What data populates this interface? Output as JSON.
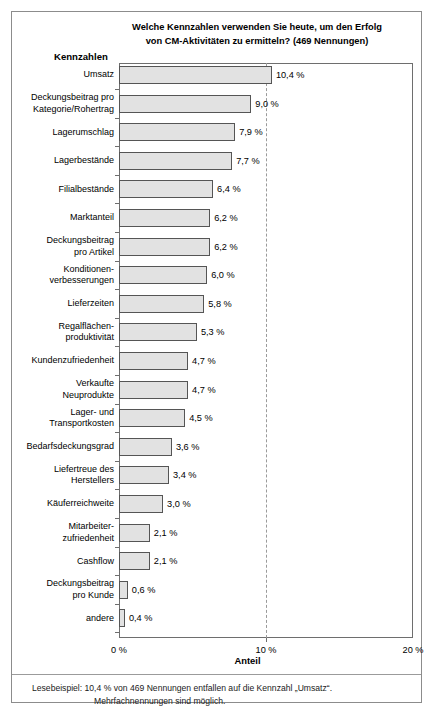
{
  "chart_data": {
    "type": "bar",
    "orientation": "horizontal",
    "title": "Welche Kennzahlen verwenden Sie heute, um den Erfolg von CM-Aktivitäten zu ermitteln? (469 Nennungen)",
    "title_line1": "Welche Kennzahlen verwenden Sie heute, um den Erfolg",
    "title_line2": "von CM-Aktivitäten zu ermitteln? (469 Nennungen)",
    "ylabel": "Kennzahlen",
    "xlabel": "Anteil",
    "xlim": [
      0,
      20
    ],
    "xticks": [
      0,
      10,
      20
    ],
    "xtick_labels": [
      "0 %",
      "10 %",
      "20 %"
    ],
    "gridline_at": 10,
    "grid": false,
    "legend": "none",
    "bar_fill_color": "#e2e2e2",
    "bar_edge_color": "#555555",
    "categories": [
      "Umsatz",
      "Deckungsbeitrag pro\nKategorie/Rohertrag",
      "Lagerumschlag",
      "Lagerbestände",
      "Filialbestände",
      "Marktanteil",
      "Deckungsbeitrag\npro Artikel",
      "Konditionen-\nverbesserungen",
      "Lieferzeiten",
      "Regalflächen-\nproduktivität",
      "Kundenzufriedenheit",
      "Verkaufte\nNeuprodukte",
      "Lager- und\nTransportkosten",
      "Bedarfsdeckungsgrad",
      "Liefertreue des\nHerstellers",
      "Käuferreichweite",
      "Mitarbeiter-\nzufriedenheit",
      "Cashflow",
      "Deckungsbeitrag\npro Kunde",
      "andere"
    ],
    "values": [
      10.4,
      9.0,
      7.9,
      7.7,
      6.4,
      6.2,
      6.2,
      6.0,
      5.8,
      5.3,
      4.7,
      4.7,
      4.5,
      3.6,
      3.4,
      3.0,
      2.1,
      2.1,
      0.6,
      0.4
    ],
    "value_labels": [
      "10,4 %",
      "9,0 %",
      "7,9 %",
      "7,7 %",
      "6,4 %",
      "6,2 %",
      "6,2 %",
      "6,0 %",
      "5,8 %",
      "5,3 %",
      "4,7 %",
      "4,7 %",
      "4,5 %",
      "3,6 %",
      "3,4 %",
      "3,0 %",
      "2,1 %",
      "2,1 %",
      "0,6 %",
      "0,4 %"
    ]
  },
  "footnote": {
    "line1": "Lesebeispiel: 10,4 % von 469 Nennungen entfallen auf die Kennzahl „Umsatz“.",
    "line2": "Mehrfachnennungen sind möglich."
  }
}
